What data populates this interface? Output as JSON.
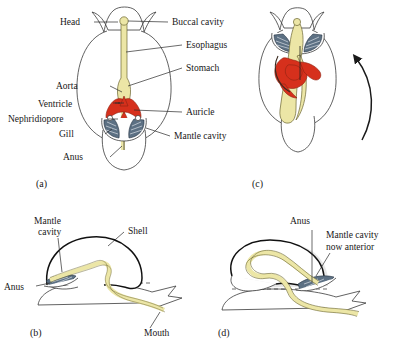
{
  "figure": {
    "colors": {
      "gut": "#ece6a6",
      "heart_red": "#d6301c",
      "gill_blue": "#5c7083",
      "outline": "#3a3a3a",
      "shell_outline": "#111111",
      "text": "#171717"
    },
    "panels": [
      {
        "id": "a",
        "letter": "(a)",
        "caption": "Pretorsional veliger: dorsal view with mantle cavity posterior",
        "labels_left": [
          {
            "text": "Head",
            "x": 72,
            "y": 25
          },
          {
            "text": "Aorta",
            "x": 88,
            "y": 89
          },
          {
            "text": "Ventricle",
            "x": 88,
            "y": 106
          },
          {
            "text": "Nephridiopore",
            "x": 88,
            "y": 122
          },
          {
            "text": "Gill",
            "x": 88,
            "y": 137
          },
          {
            "text": "Anus",
            "x": 92,
            "y": 160
          }
        ],
        "labels_right": [
          {
            "text": "Buccal cavity",
            "x": 172,
            "y": 25
          },
          {
            "text": "Esophagus",
            "x": 186,
            "y": 48
          },
          {
            "text": "Stomach",
            "x": 186,
            "y": 71
          },
          {
            "text": "Auricle",
            "x": 186,
            "y": 115
          },
          {
            "text": "Mantle cavity",
            "x": 174,
            "y": 139
          }
        ]
      },
      {
        "id": "c",
        "letter": "(c)",
        "caption": "Posttorsional veliger: mantle cavity rotated to anterior",
        "labels": [],
        "rotation_arrow": "counterclockwise-180-degree-rotation"
      },
      {
        "id": "b",
        "letter": "(b)",
        "caption": "Pretorsional lateral view",
        "labels": [
          {
            "text": "Mantle",
            "x": 34,
            "y": 224
          },
          {
            "text": "cavity",
            "x": 38,
            "y": 235
          },
          {
            "text": "Shell",
            "x": 128,
            "y": 234
          },
          {
            "text": "Anus",
            "x": 8,
            "y": 289
          },
          {
            "text": "Mouth",
            "x": 148,
            "y": 334
          }
        ]
      },
      {
        "id": "d",
        "letter": "(d)",
        "caption": "Posttorsional lateral view",
        "labels": [
          {
            "text": "Anus",
            "x": 290,
            "y": 224
          },
          {
            "text": "Mantle cavity",
            "x": 326,
            "y": 237
          },
          {
            "text": "now anterior",
            "x": 326,
            "y": 249
          }
        ]
      }
    ]
  }
}
